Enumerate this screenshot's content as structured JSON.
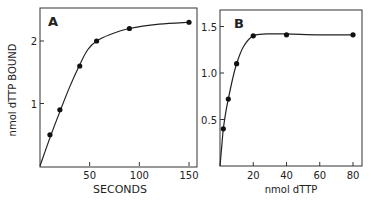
{
  "chart_data": [
    {
      "type": "line",
      "panel": "A",
      "title": "A",
      "xlabel": "SECONDS",
      "ylabel": "nmol dTTP BOUND",
      "xlim": [
        0,
        155
      ],
      "ylim": [
        0,
        2.4
      ],
      "xticks": [
        50,
        100,
        150
      ],
      "xtick_labels": [
        "50",
        "100",
        "150"
      ],
      "yticks": [
        1,
        2
      ],
      "ytick_labels": [
        "1",
        "2"
      ],
      "grid": false,
      "series": [
        {
          "name": "binding",
          "x": [
            10,
            20,
            40,
            57,
            90,
            150
          ],
          "y": [
            0.5,
            0.9,
            1.6,
            2.0,
            2.2,
            2.3
          ]
        }
      ],
      "curve": {
        "x": [
          0,
          10,
          20,
          30,
          40,
          48,
          57,
          70,
          90,
          120,
          150
        ],
        "y": [
          0,
          0.45,
          0.87,
          1.27,
          1.62,
          1.86,
          2.0,
          2.1,
          2.2,
          2.27,
          2.3
        ]
      }
    },
    {
      "type": "line",
      "panel": "B",
      "title": "B",
      "xlabel": "nmol dTTP",
      "ylabel": "",
      "xlim": [
        0,
        85
      ],
      "ylim": [
        0,
        1.7
      ],
      "xticks": [
        20,
        40,
        60,
        80
      ],
      "xtick_labels": [
        "20",
        "40",
        "60",
        "80"
      ],
      "yticks": [
        0.5,
        1.0,
        1.5
      ],
      "ytick_labels": [
        "0.5",
        "1.0",
        "1.5"
      ],
      "grid": false,
      "series": [
        {
          "name": "saturation",
          "x": [
            2,
            5,
            10,
            20,
            40,
            80
          ],
          "y": [
            0.4,
            0.72,
            1.1,
            1.4,
            1.41,
            1.41
          ]
        }
      ],
      "curve": {
        "x": [
          0,
          1,
          2,
          3.5,
          5,
          7.5,
          10,
          14,
          20,
          28,
          40,
          60,
          80
        ],
        "y": [
          0,
          0.2,
          0.4,
          0.58,
          0.72,
          0.93,
          1.1,
          1.28,
          1.4,
          1.42,
          1.42,
          1.41,
          1.41
        ]
      }
    }
  ],
  "labels": {
    "panel_a": "A",
    "panel_b": "B",
    "a_xlabel": "SECONDS",
    "a_ylabel": "nmol dTTP BOUND",
    "b_xlabel": "nmol dTTP"
  }
}
